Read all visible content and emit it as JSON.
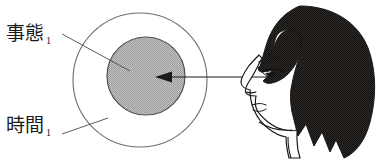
{
  "figure": {
    "type": "diagram",
    "background_color": "#ffffff",
    "width": 379,
    "height": 162,
    "labels": [
      {
        "id": "jitai",
        "text": "事態",
        "subscript": "1",
        "points_to": "inner-gray-circle",
        "x": 6,
        "y": 24
      },
      {
        "id": "jikan",
        "text": "時間",
        "subscript": "1",
        "points_to": "outer-circle",
        "x": 6,
        "y": 116
      }
    ],
    "shapes": {
      "outer_circle": {
        "name": "outer-circle",
        "cx": 140,
        "cy": 80,
        "r": 67,
        "fill": "#ffffff",
        "stroke": "#6b6b6b",
        "stroke_width": 1
      },
      "inner_circle": {
        "name": "inner-gray-circle",
        "cx": 146,
        "cy": 76,
        "r": 39,
        "fill": "#b9b9b9",
        "stroke": "#4a4a4a",
        "stroke_width": 1
      }
    },
    "arrow": {
      "name": "gaze-arrow",
      "from_x": 268,
      "from_y": 77,
      "to_x": 155,
      "to_y": 77,
      "direction": "left",
      "color": "#1a1a1a"
    },
    "leader_lines": [
      {
        "name": "leader-line-jitai",
        "x1": 62,
        "y1": 34,
        "x2": 128,
        "y2": 70
      },
      {
        "name": "leader-line-jikan",
        "x1": 62,
        "y1": 134,
        "x2": 107,
        "y2": 119
      }
    ],
    "face": {
      "name": "woman-profile-face",
      "facing": "left",
      "hair_color": "#231f20",
      "skin_outline_color": "#1a1a1a",
      "features": [
        "hair",
        "bangs",
        "eyebrow",
        "eye",
        "nose",
        "lips",
        "chin",
        "neck",
        "ear-hidden"
      ]
    }
  }
}
